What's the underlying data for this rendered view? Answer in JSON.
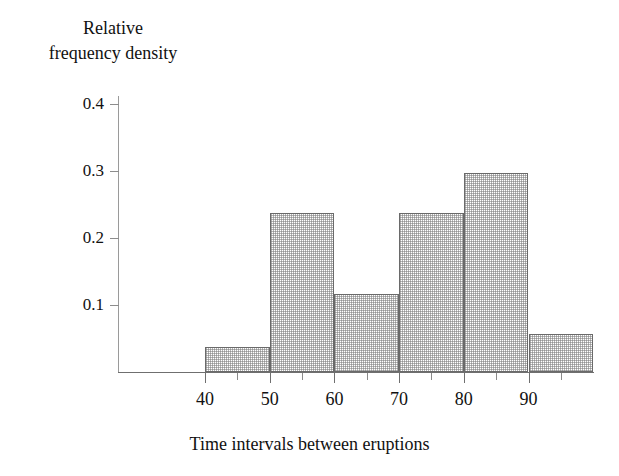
{
  "chart_data": {
    "type": "bar",
    "title": "",
    "subtitle": "",
    "ylabel": "Relative\nfrequency density",
    "xlabel": "Time intervals between eruptions",
    "xlim": [
      35,
      101
    ],
    "ylim": [
      0,
      0.4
    ],
    "grid": false,
    "legend": null,
    "y_ticks": [
      "0.4",
      "0.3",
      "0.2",
      "0.1"
    ],
    "y_tick_values": [
      0.4,
      0.3,
      0.2,
      0.1
    ],
    "x_ticks": [
      "40",
      "50",
      "60",
      "70",
      "80",
      "90"
    ],
    "x_tick_values": [
      40,
      50,
      60,
      70,
      80,
      90
    ],
    "x_minor_tick_values": [
      45,
      55,
      65,
      75,
      85,
      95
    ],
    "bin_edges": [
      40,
      50,
      60,
      70,
      80,
      90,
      100
    ],
    "categories": [
      "40-50",
      "50-60",
      "60-70",
      "70-80",
      "80-90",
      "90-100"
    ],
    "values": [
      0.038,
      0.238,
      0.117,
      0.237,
      0.297,
      0.056
    ],
    "bars": [
      {
        "label": "40-50",
        "start": 40,
        "end": 50,
        "value": 0.038
      },
      {
        "label": "50-60",
        "start": 50,
        "end": 60,
        "value": 0.238
      },
      {
        "label": "60-70",
        "start": 60,
        "end": 70,
        "value": 0.117
      },
      {
        "label": "70-80",
        "start": 70,
        "end": 80,
        "value": 0.237
      },
      {
        "label": "80-90",
        "start": 80,
        "end": 90,
        "value": 0.297
      },
      {
        "label": "90-100",
        "start": 90,
        "end": 100,
        "value": 0.056
      }
    ],
    "colors": {
      "bar_fill": "#ffffff",
      "bar_pattern": "#787878",
      "bar_border": "#6a6a6a",
      "axis": "#6f6f6f",
      "text": "#111111",
      "background": "#ffffff"
    }
  }
}
